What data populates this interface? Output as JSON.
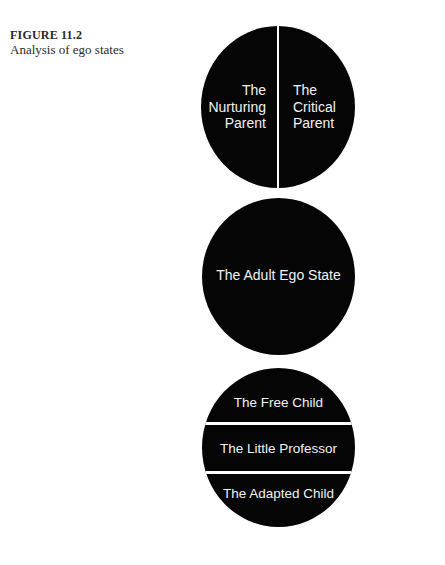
{
  "caption": {
    "figure_number": "FIGURE 11.2",
    "description": "Analysis of ego states"
  },
  "diagram": {
    "parent": {
      "left": [
        "The",
        "Nurturing",
        "Parent"
      ],
      "right": [
        "The",
        "Critical",
        "Parent"
      ]
    },
    "adult": {
      "label": "The Adult Ego State"
    },
    "child": {
      "bands": [
        "The Free Child",
        "The Little Professor",
        "The Adapted Child"
      ]
    },
    "colors": {
      "circle_fill": "#050505",
      "text": "#f2f2f2",
      "divider": "#ffffff"
    }
  }
}
